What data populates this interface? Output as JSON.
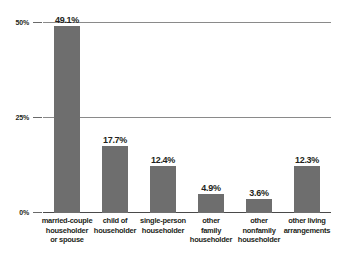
{
  "chart_data": {
    "type": "bar",
    "title": "",
    "xlabel": "",
    "ylabel": "",
    "ylim": [
      0,
      50
    ],
    "grid": true,
    "legend": "none",
    "yticks": [
      "0%",
      "25%",
      "50%"
    ],
    "ytick_values": [
      0,
      25,
      50
    ],
    "categories": [
      "married-couple householder or spouse",
      "child of householder",
      "single-person householder",
      "other family householder",
      "other nonfamily householder",
      "other living arrangements"
    ],
    "category_lines": [
      [
        "married-couple",
        "householder",
        "or spouse"
      ],
      [
        "child of",
        "householder"
      ],
      [
        "single-person",
        "householder"
      ],
      [
        "other",
        "family",
        "householder"
      ],
      [
        "other",
        "nonfamily",
        "householder"
      ],
      [
        "other living",
        "arrangements"
      ]
    ],
    "values": [
      49.1,
      17.7,
      12.4,
      4.9,
      3.6,
      12.3
    ],
    "value_labels": [
      "49.1%",
      "17.7%",
      "12.4%",
      "4.9%",
      "3.6%",
      "12.3%"
    ],
    "bar_color": "#6e6e6e",
    "gridline_color": "#8a8a8a",
    "axis_color": "#4a4a4a",
    "text_color": "#231f20",
    "background": "#ffffff"
  }
}
